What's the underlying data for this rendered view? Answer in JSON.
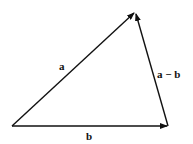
{
  "diagram": {
    "type": "vector-triangle",
    "vectors": [
      {
        "name": "a",
        "label": "a",
        "from": [
          12,
          126
        ],
        "to": [
          135,
          12
        ]
      },
      {
        "name": "b",
        "label": "b",
        "from": [
          12,
          126
        ],
        "to": [
          168,
          126
        ]
      },
      {
        "name": "a-b",
        "label": "a − b",
        "from": [
          168,
          126
        ],
        "to": [
          135,
          12
        ]
      }
    ],
    "color": "#111111"
  }
}
